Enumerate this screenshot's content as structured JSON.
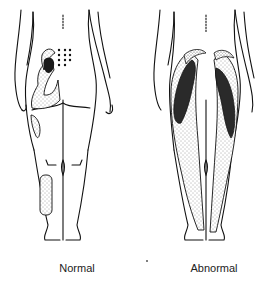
{
  "figures": [
    {
      "id": "normal",
      "caption": "Normal"
    },
    {
      "id": "abnormal",
      "caption": "Abnormal"
    }
  ],
  "colors": {
    "line": "#111111",
    "dark_fill": "#2a2a2a",
    "stipple": "#444444",
    "background": "#ffffff"
  }
}
